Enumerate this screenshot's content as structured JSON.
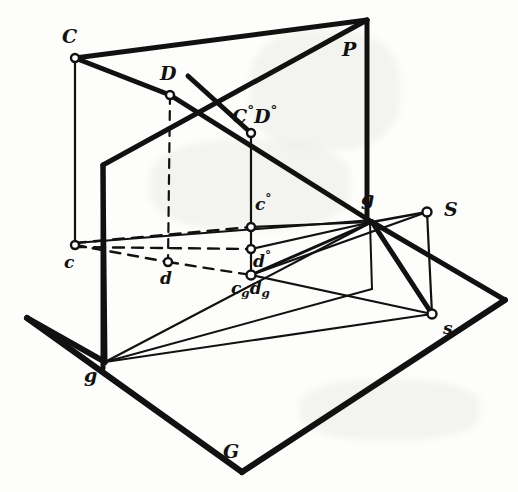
{
  "figure": {
    "stroke_color": "#111111",
    "background_color": "#fdfdfb",
    "labels": [
      {
        "id": "C",
        "text": "C",
        "sup": "",
        "sub": "",
        "x": 62,
        "y": 27,
        "size": "big"
      },
      {
        "id": "D",
        "text": "D",
        "sup": "",
        "sub": "",
        "x": 160,
        "y": 64,
        "size": "big"
      },
      {
        "id": "P",
        "text": "P",
        "sup": "",
        "sub": "",
        "x": 342,
        "y": 40,
        "size": "big"
      },
      {
        "id": "C0D0",
        "text": "C",
        "sup": "°",
        "sub": "",
        "x": 232,
        "y": 104,
        "size": "big",
        "text2": "D",
        "sup2": "°"
      },
      {
        "id": "c0",
        "text": "c",
        "sup": "°",
        "sub": "",
        "x": 255,
        "y": 193,
        "size": "mid"
      },
      {
        "id": "d0",
        "text": "d",
        "sup": "°",
        "sub": "",
        "x": 253,
        "y": 250,
        "size": "mid"
      },
      {
        "id": "g_vp",
        "text": "g",
        "sup": "",
        "sub": "",
        "x": 361,
        "y": 189,
        "size": "big"
      },
      {
        "id": "S",
        "text": "S",
        "sup": "",
        "sub": "",
        "x": 444,
        "y": 200,
        "size": "big"
      },
      {
        "id": "c",
        "text": "c",
        "sup": "",
        "sub": "",
        "x": 64,
        "y": 254,
        "size": "mid"
      },
      {
        "id": "d",
        "text": "d",
        "sup": "",
        "sub": "",
        "x": 160,
        "y": 270,
        "size": "mid"
      },
      {
        "id": "cgdg",
        "text": "c",
        "sup": "",
        "sub": "g",
        "x": 231,
        "y": 280,
        "size": "mid",
        "text2": "d",
        "sub2": "g"
      },
      {
        "id": "s",
        "text": "s",
        "sup": "",
        "sub": "",
        "x": 443,
        "y": 320,
        "size": "mid"
      },
      {
        "id": "g_tr",
        "text": "g",
        "sup": "",
        "sub": "",
        "x": 84,
        "y": 366,
        "size": "big"
      },
      {
        "id": "G",
        "text": "G",
        "sup": "",
        "sub": "",
        "x": 223,
        "y": 442,
        "size": "big"
      }
    ],
    "points": [
      {
        "id": "C",
        "x": 75,
        "y": 58,
        "open": true
      },
      {
        "id": "D",
        "x": 170,
        "y": 95,
        "open": true
      },
      {
        "id": "C0D0",
        "x": 251,
        "y": 133,
        "open": true
      },
      {
        "id": "c0",
        "x": 251,
        "y": 227,
        "open": true
      },
      {
        "id": "d0",
        "x": 251,
        "y": 249,
        "open": true
      },
      {
        "id": "c",
        "x": 75,
        "y": 245,
        "open": true
      },
      {
        "id": "d",
        "x": 168,
        "y": 262,
        "open": true
      },
      {
        "id": "cgdg",
        "x": 251,
        "y": 275,
        "open": true
      },
      {
        "id": "S",
        "x": 427,
        "y": 212,
        "open": true
      },
      {
        "id": "s",
        "x": 432,
        "y": 314,
        "open": true
      }
    ],
    "planes": {
      "picture_plane_P": {
        "label": "P",
        "outline": "103,165 103,368 367,289 367,20",
        "note": "vertical picture plane, trace g-g on ground"
      },
      "ground_plane_G": {
        "label": "G",
        "outline": "27,318 242,472 505,300 290,170",
        "note": "horizontal ground plane"
      }
    },
    "line_kinds": {
      "solid": "visible edge",
      "dashed": "hidden / projecting ray"
    }
  }
}
